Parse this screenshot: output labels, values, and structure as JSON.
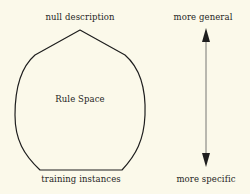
{
  "diagram": {
    "top_label": "null description",
    "center_label": "Rule Space",
    "bottom_label": "training instances",
    "axis_top_label": "more general",
    "axis_bottom_label": "more specific"
  },
  "colors": {
    "background": "#fbf9ea",
    "stroke": "#1e1e1e",
    "arrow": "#555555"
  }
}
